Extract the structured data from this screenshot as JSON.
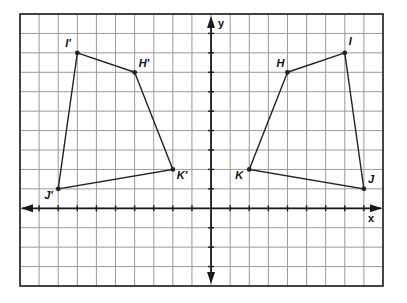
{
  "diagram": {
    "type": "coordinate-grid",
    "x_axis_label": "x",
    "y_axis_label": "y",
    "x_range": [
      -10,
      9
    ],
    "y_range": [
      -4,
      10
    ],
    "grid_step": 1,
    "colors": {
      "grid": "#9a9a9a",
      "frame": "#222222",
      "axis": "#1a1a1a",
      "shape": "#222222"
    },
    "shapes": [
      {
        "name": "HIJK",
        "vertices": [
          {
            "label": "H",
            "x": 4,
            "y": 7
          },
          {
            "label": "I",
            "x": 7,
            "y": 8
          },
          {
            "label": "J",
            "x": 8,
            "y": 1
          },
          {
            "label": "K",
            "x": 2,
            "y": 2
          }
        ]
      },
      {
        "name": "H'I'J'K'",
        "vertices": [
          {
            "label": "H'",
            "x": -4,
            "y": 7
          },
          {
            "label": "I'",
            "x": -7,
            "y": 8
          },
          {
            "label": "J'",
            "x": -8,
            "y": 1
          },
          {
            "label": "K'",
            "x": -2,
            "y": 2
          }
        ]
      }
    ]
  }
}
